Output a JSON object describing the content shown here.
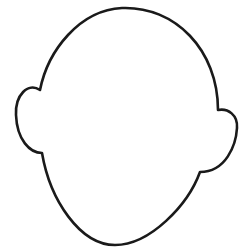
{
  "drawing": {
    "subject": "blank face outline",
    "description": "Head outline with two ears, no facial features",
    "stroke_color": "#1a1a1a",
    "fill_color": "#ffffff"
  }
}
